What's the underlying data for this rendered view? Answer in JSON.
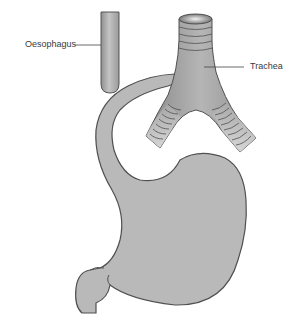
{
  "diagram": {
    "type": "anatomical illustration",
    "labels": {
      "oesophagus": "Oesophagus",
      "trachea": "Trachea"
    },
    "colors": {
      "organ_fill": "#b8b8b8",
      "organ_stroke": "#555555",
      "leader_line": "#444444",
      "label_text": "#3a3a3a",
      "background": "#ffffff"
    }
  }
}
